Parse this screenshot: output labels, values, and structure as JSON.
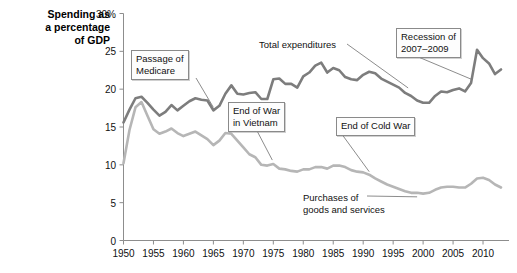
{
  "chart_data": {
    "type": "line",
    "title": "",
    "ylabel": "Spending as\na percentage\nof GDP",
    "xlabel": "",
    "xlim": [
      1950,
      2013
    ],
    "ylim": [
      0,
      30
    ],
    "yticks": [
      "0",
      "5",
      "10",
      "15",
      "20",
      "25",
      "30%"
    ],
    "ytick_values": [
      0,
      5,
      10,
      15,
      20,
      25,
      30
    ],
    "xticks": [
      "1950",
      "1955",
      "1960",
      "1965",
      "1970",
      "1975",
      "1980",
      "1985",
      "1990",
      "1995",
      "2000",
      "2005",
      "2010"
    ],
    "xtick_values": [
      1950,
      1955,
      1960,
      1965,
      1970,
      1975,
      1980,
      1985,
      1990,
      1995,
      2000,
      2005,
      2010
    ],
    "grid": false,
    "legend_position": "inline-annotations",
    "series": [
      {
        "name": "Total expenditures",
        "color": "#7d7d7d",
        "x": [
          1950,
          1951,
          1952,
          1953,
          1954,
          1955,
          1956,
          1957,
          1958,
          1959,
          1960,
          1961,
          1962,
          1963,
          1964,
          1965,
          1966,
          1967,
          1968,
          1969,
          1970,
          1971,
          1972,
          1973,
          1974,
          1975,
          1976,
          1977,
          1978,
          1979,
          1980,
          1981,
          1982,
          1983,
          1984,
          1985,
          1986,
          1987,
          1988,
          1989,
          1990,
          1991,
          1992,
          1993,
          1994,
          1995,
          1996,
          1997,
          1998,
          1999,
          2000,
          2001,
          2002,
          2003,
          2004,
          2005,
          2006,
          2007,
          2008,
          2009,
          2010,
          2011,
          2012,
          2013
        ],
        "y": [
          15.6,
          17.3,
          18.8,
          19.0,
          18.2,
          17.3,
          16.5,
          17.0,
          17.9,
          17.2,
          17.8,
          18.4,
          18.8,
          18.6,
          18.5,
          17.2,
          17.8,
          19.4,
          20.5,
          19.4,
          19.3,
          19.5,
          19.6,
          18.7,
          18.7,
          21.3,
          21.4,
          20.7,
          20.7,
          20.2,
          21.7,
          22.2,
          23.1,
          23.5,
          22.2,
          22.8,
          22.5,
          21.6,
          21.3,
          21.2,
          21.9,
          22.3,
          22.1,
          21.4,
          21.0,
          20.6,
          20.2,
          19.5,
          19.1,
          18.5,
          18.2,
          18.2,
          19.1,
          19.7,
          19.6,
          19.9,
          20.1,
          19.7,
          20.8,
          25.2,
          24.1,
          23.4,
          22.0,
          22.6
        ]
      },
      {
        "name": "Purchases of goods and services",
        "color": "#b6b6b6",
        "x": [
          1950,
          1951,
          1952,
          1953,
          1954,
          1955,
          1956,
          1957,
          1958,
          1959,
          1960,
          1961,
          1962,
          1963,
          1964,
          1965,
          1966,
          1967,
          1968,
          1969,
          1970,
          1971,
          1972,
          1973,
          1974,
          1975,
          1976,
          1977,
          1978,
          1979,
          1980,
          1981,
          1982,
          1983,
          1984,
          1985,
          1986,
          1987,
          1988,
          1989,
          1990,
          1991,
          1992,
          1993,
          1994,
          1995,
          1996,
          1997,
          1998,
          1999,
          2000,
          2001,
          2002,
          2003,
          2004,
          2005,
          2006,
          2007,
          2008,
          2009,
          2010,
          2011,
          2012,
          2013
        ],
        "y": [
          10.2,
          14.6,
          17.6,
          18.3,
          16.5,
          14.7,
          14.1,
          14.4,
          14.8,
          14.2,
          13.8,
          14.1,
          14.4,
          13.9,
          13.4,
          12.6,
          13.2,
          14.2,
          14.1,
          13.2,
          12.3,
          11.4,
          11.0,
          10.0,
          9.9,
          10.1,
          9.5,
          9.4,
          9.2,
          9.1,
          9.4,
          9.4,
          9.7,
          9.7,
          9.5,
          9.9,
          9.9,
          9.7,
          9.3,
          9.1,
          9.0,
          8.7,
          8.2,
          7.8,
          7.4,
          7.1,
          6.8,
          6.5,
          6.3,
          6.3,
          6.2,
          6.3,
          6.7,
          7.0,
          7.1,
          7.1,
          7.0,
          7.0,
          7.5,
          8.2,
          8.3,
          8.0,
          7.4,
          7.0
        ]
      }
    ],
    "annotations": [
      {
        "id": "passage-of-medicare",
        "text": "Passage of\nMedicare",
        "target_year": 1965,
        "target_value": 17.2
      },
      {
        "id": "end-of-war-in-vietnam",
        "text": "End of War\nin Vietnam",
        "target_year": 1975,
        "target_value": 10.1
      },
      {
        "id": "end-of-cold-war",
        "text": "End of Cold War",
        "target_year": 1991,
        "target_value": 8.7
      },
      {
        "id": "recession-of-2007-2009",
        "text": "Recession of\n2007–2009",
        "target_year": 2008,
        "target_value": 20.8
      }
    ],
    "series_labels": [
      {
        "id": "total-expenditures",
        "text": "Total expenditures"
      },
      {
        "id": "purchases-of-goods-and-services",
        "text": "Purchases of\ngoods and services"
      }
    ]
  }
}
